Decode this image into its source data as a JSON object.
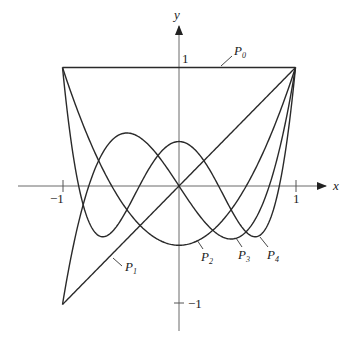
{
  "figure": {
    "axes": {
      "x_label": "x",
      "y_label": "y",
      "x_ticks": [
        {
          "value": -1,
          "label": "−1"
        },
        {
          "value": 1,
          "label": "1"
        }
      ],
      "y_ticks": [
        {
          "value": 1,
          "label": "1"
        },
        {
          "value": -1,
          "label": "−1"
        }
      ],
      "xlim": [
        -1,
        1
      ],
      "ylim": [
        -1,
        1
      ]
    },
    "curves": [
      {
        "name": "P0",
        "label_main": "P",
        "label_sub": "0",
        "formula": "1"
      },
      {
        "name": "P1",
        "label_main": "P",
        "label_sub": "1",
        "formula": "x"
      },
      {
        "name": "P2",
        "label_main": "P",
        "label_sub": "2",
        "formula": "(3x^2-1)/2"
      },
      {
        "name": "P3",
        "label_main": "P",
        "label_sub": "3",
        "formula": "(5x^3-3x)/2"
      },
      {
        "name": "P4",
        "label_main": "P",
        "label_sub": "4",
        "formula": "(35x^4-30x^2+3)/8"
      }
    ],
    "colors": {
      "curve": "#2a2a2a",
      "axis": "#6a6a6a",
      "background": "#ffffff"
    }
  }
}
